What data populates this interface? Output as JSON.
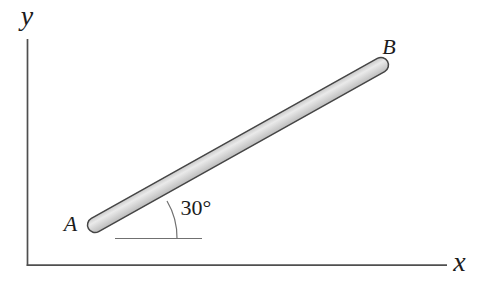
{
  "figure": {
    "background": "#ffffff",
    "text_color": "#1c1c1c",
    "axes": {
      "x_label": "x",
      "y_label": "y",
      "line_color": "#4f4f4f"
    },
    "rod": {
      "label_a": "A",
      "label_b": "B",
      "outline_color": "#454545",
      "fill_edge_top": "#cccccc",
      "fill_highlight": "#eaeaea",
      "fill_edge_bottom": "#bfbfbf"
    },
    "angle": {
      "label": "30°",
      "guide_color": "#707070"
    }
  }
}
